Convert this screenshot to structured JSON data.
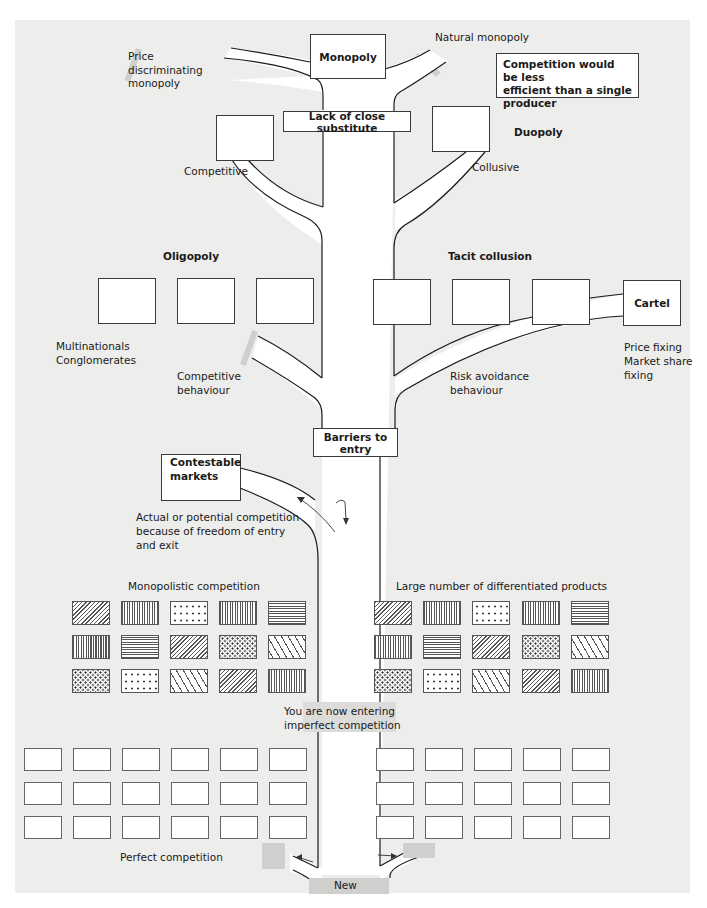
{
  "diagram": {
    "type": "tree-of-market-structures",
    "top": {
      "monopoly": "Monopoly",
      "price_discriminating": [
        "Price",
        "discriminating",
        "monopoly"
      ],
      "natural_monopoly": "Natural monopoly",
      "natural_monopoly_reason": [
        "Competition would be less",
        "efficient than a single",
        "producer"
      ],
      "lack_of_close_substitute": "Lack of close substitute"
    },
    "duopoly": {
      "title": "Duopoly",
      "competitive": "Competitive",
      "collusive": "Collusive"
    },
    "oligopoly": {
      "title": "Oligopoly",
      "tacit_collusion": "Tacit collusion",
      "multinationals": [
        "Multinationals",
        "Conglomerates"
      ],
      "competitive_behaviour": [
        "Competitive",
        "behaviour"
      ],
      "risk_avoidance": [
        "Risk avoidance",
        "behaviour"
      ],
      "cartel": "Cartel",
      "cartel_notes": [
        "Price fixing",
        "Market share",
        "fixing"
      ]
    },
    "barriers": {
      "barriers_to_entry": "Barriers to entry",
      "contestable_markets": [
        "Contestable",
        "markets"
      ],
      "contestable_note": [
        "Actual or potential competition",
        "because of freedom of entry",
        "and exit"
      ]
    },
    "monopolistic": {
      "left_label": "Monopolistic competition",
      "right_label": "Large number of differentiated products",
      "patterns": [
        [
          "diag",
          "vert",
          "dots-sparse",
          "vert",
          "horiz"
        ],
        [
          "vert",
          "horiz",
          "diag",
          "dots-dense",
          "ticks"
        ],
        [
          "dots-dense",
          "dots-sparse",
          "ticks",
          "diag",
          "vert"
        ]
      ]
    },
    "imperfect_entry": [
      "You are now entering",
      "imperfect competition"
    ],
    "perfect": {
      "label": "Perfect competition",
      "left_grid": {
        "rows": 3,
        "cols": 6
      },
      "right_grid": {
        "rows": 3,
        "cols": 5
      }
    },
    "new_entry": "New"
  },
  "colors": {
    "panel_bg": "#ededeb",
    "box_bg": "#ffffff",
    "line": "#1a1a1a",
    "grey_tag": "#cfcfcd"
  }
}
